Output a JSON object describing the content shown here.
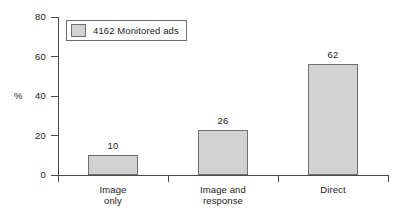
{
  "chart_data": {
    "type": "bar",
    "title": "",
    "xlabel": "",
    "ylabel": "%",
    "categories": [
      "Image\nonly",
      "Image and\nresponse",
      "Direct"
    ],
    "categories_flat": [
      "Image only",
      "Image and response",
      "Direct"
    ],
    "values": [
      10,
      26,
      62
    ],
    "plotted_heights": [
      10,
      23,
      56
    ],
    "data_labels": [
      "10",
      "26",
      "62"
    ],
    "ylim": [
      0,
      80
    ],
    "yticks": [
      0,
      20,
      40,
      60,
      80
    ],
    "ytick_labels": [
      "0",
      "20",
      "40",
      "60",
      "80"
    ],
    "grid": false,
    "legend_position": "upper-left",
    "legend": [
      {
        "label": "4162 Monitored ads",
        "color": "#d2d2d2"
      }
    ],
    "series": [
      {
        "name": "4162 Monitored ads",
        "values": [
          10,
          26,
          62
        ]
      }
    ],
    "colors": {
      "bar_fill": "#d2d2d2",
      "bar_border": "#707070",
      "axis": "#4a4a4a",
      "text": "#1c1c1c",
      "background": "#ffffff"
    }
  }
}
